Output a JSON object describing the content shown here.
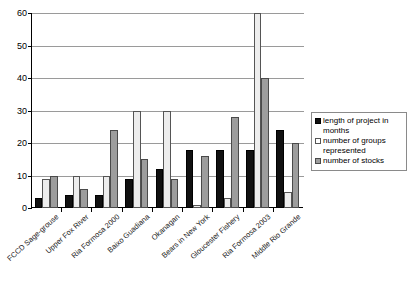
{
  "chart_data": {
    "type": "bar",
    "title": "",
    "subtitle": "",
    "xlabel": "",
    "ylabel": "",
    "ylim": [
      0,
      60
    ],
    "y_ticks": [
      0,
      10,
      20,
      30,
      40,
      50,
      60
    ],
    "grid": true,
    "legend_position": "right",
    "categories": [
      "FCCD Sage-grouse",
      "Upper Fox River",
      "Ria Formosa 2000",
      "Baixo Guadiana",
      "Okanagan",
      "Bears in New York",
      "Gloucester Fishery",
      "Ria Formosa 2003",
      "Middle Rio Grande"
    ],
    "series": [
      {
        "name": "length of project in months",
        "color": "#111111",
        "values": [
          3,
          4,
          4,
          9,
          12,
          18,
          18,
          18,
          24
        ]
      },
      {
        "name": "number of groups represented",
        "color": "#ededed",
        "values": [
          9,
          10,
          10,
          30,
          30,
          1,
          3,
          60,
          5
        ]
      },
      {
        "name": "number of stocks",
        "color": "#9d9d9d",
        "values": [
          10,
          6,
          24,
          15,
          9,
          16,
          28,
          40,
          20
        ]
      }
    ]
  },
  "legend": {
    "items": [
      {
        "label": "length of project in months"
      },
      {
        "label": "number of groups represented"
      },
      {
        "label": "number of stocks"
      }
    ]
  }
}
